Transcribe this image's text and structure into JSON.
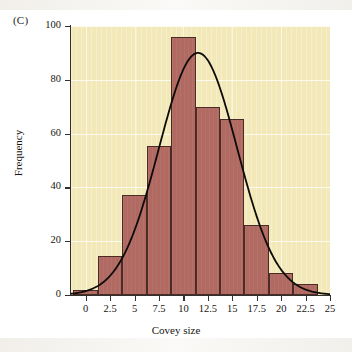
{
  "figure": {
    "panel_label": "(C)"
  },
  "chart_data": {
    "type": "bar",
    "title": "",
    "xlabel": "Covey size",
    "ylabel": "Frequency",
    "xlim": [
      -1.5,
      25
    ],
    "ylim": [
      0,
      100
    ],
    "grid": true,
    "legend": "none",
    "bin_width": 2.5,
    "x_ticks": [
      "0",
      "2.5",
      "5",
      "7.5",
      "10",
      "12.5",
      "15",
      "17.5",
      "20",
      "22.5",
      "25"
    ],
    "x_tick_values": [
      0,
      2.5,
      5,
      7.5,
      10,
      12.5,
      15,
      17.5,
      20,
      22.5,
      25
    ],
    "y_ticks": [
      "0",
      "20",
      "40",
      "60",
      "80",
      "100"
    ],
    "y_tick_values": [
      0,
      20,
      40,
      60,
      80,
      100
    ],
    "bin_edges": [
      -1.25,
      1.25,
      3.75,
      6.25,
      8.75,
      11.25,
      13.75,
      16.25,
      18.75,
      21.25,
      23.75
    ],
    "categories": [
      "0",
      "2.5",
      "5",
      "7.5",
      "10",
      "12.5",
      "15",
      "17.5",
      "20",
      "22.5"
    ],
    "values": [
      2,
      14.5,
      37,
      55.5,
      96,
      70,
      65.5,
      26,
      8,
      4
    ],
    "overlay_curve": {
      "name": "normal fit curve",
      "peak_x": 11.5,
      "peak_y": 90,
      "mean": 11.5,
      "sd": 4.0,
      "amplitude": 90,
      "color": "#0d0b08"
    },
    "colors": {
      "bar_fill": "#b06a62",
      "bar_edge": "#4a2b26",
      "plot_background": "#f2e8b8",
      "axis": "#33312c",
      "gridline": "#ffffff",
      "curve": "#0d0b08"
    }
  }
}
